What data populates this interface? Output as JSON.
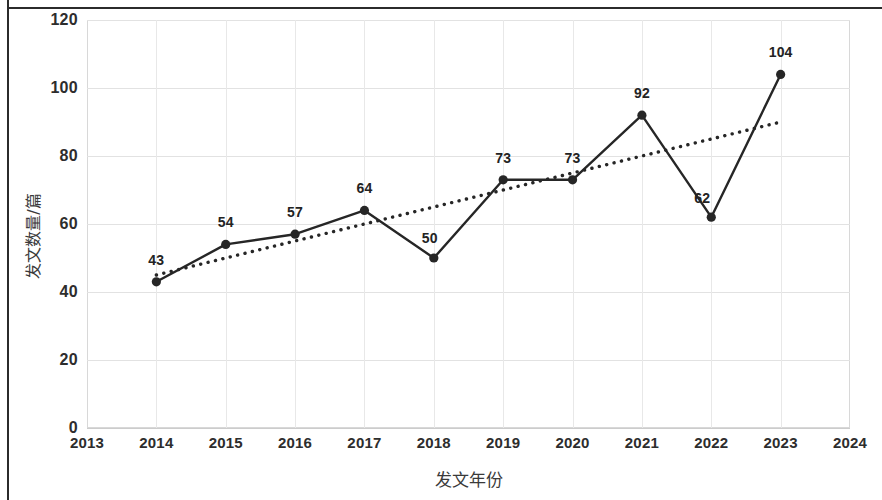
{
  "chart_data": {
    "type": "line",
    "title": "",
    "xlabel": "发文年份",
    "ylabel": "发文数量/篇",
    "categories": [
      "2014",
      "2015",
      "2016",
      "2017",
      "2018",
      "2019",
      "2020",
      "2021",
      "2022",
      "2023"
    ],
    "values": [
      43,
      54,
      57,
      64,
      50,
      73,
      73,
      92,
      62,
      104
    ],
    "series": [
      {
        "name": "发文数量",
        "style": "solid-line-with-markers",
        "x": [
          2014,
          2015,
          2016,
          2017,
          2018,
          2019,
          2020,
          2021,
          2022,
          2023
        ],
        "values": [
          43,
          54,
          57,
          64,
          50,
          73,
          73,
          92,
          62,
          104
        ]
      },
      {
        "name": "趋势线",
        "style": "dotted-trendline",
        "x": [
          2014,
          2023
        ],
        "values": [
          45,
          90
        ]
      }
    ],
    "xlim": [
      2013,
      2024
    ],
    "ylim": [
      0,
      120
    ],
    "x_ticks": [
      "2013",
      "2014",
      "2015",
      "2016",
      "2017",
      "2018",
      "2019",
      "2020",
      "2021",
      "2022",
      "2023",
      "2024"
    ],
    "y_ticks": [
      "0",
      "20",
      "40",
      "60",
      "80",
      "100",
      "120"
    ],
    "y_tick_values": [
      0,
      20,
      40,
      60,
      80,
      100,
      120
    ],
    "grid": true,
    "legend": "none",
    "colors": {
      "line": "#262626",
      "marker": "#262626",
      "trendline": "#262626",
      "gridline": "#e2e2e2",
      "text": "#2d2d2d",
      "frame": "#2b2b2b"
    },
    "data_labels": [
      {
        "label": "43",
        "x": 2014,
        "y": 43
      },
      {
        "label": "54",
        "x": 2015,
        "y": 54
      },
      {
        "label": "57",
        "x": 2016,
        "y": 57
      },
      {
        "label": "64",
        "x": 2017,
        "y": 64
      },
      {
        "label": "50",
        "x": 2018,
        "y": 50
      },
      {
        "label": "73",
        "x": 2019,
        "y": 73
      },
      {
        "label": "73",
        "x": 2020,
        "y": 73
      },
      {
        "label": "92",
        "x": 2021,
        "y": 92
      },
      {
        "label": "62",
        "x": 2022,
        "y": 62
      },
      {
        "label": "104",
        "x": 2023,
        "y": 104
      }
    ]
  }
}
